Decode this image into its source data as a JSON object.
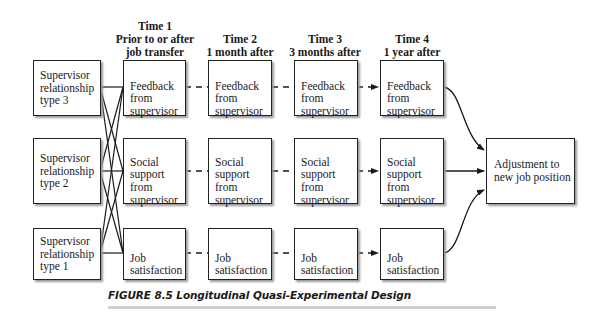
{
  "headers": [
    {
      "time": "Time 1",
      "desc": "Prior to or after",
      "desc2": "job transfer"
    },
    {
      "time": "Time 2",
      "desc": "1 month after"
    },
    {
      "time": "Time 3",
      "desc": "3 months after"
    },
    {
      "time": "Time 4",
      "desc": "1 year after"
    }
  ],
  "groups": [
    {
      "label": "Supervisor\nrelationship\ntype 3"
    },
    {
      "label": "Supervisor\nrelationship\ntype 2"
    },
    {
      "label": "Supervisor\nrelationship\ntype 1"
    }
  ],
  "measures": [
    {
      "label": "Feedback\nfrom\nsupervisor"
    },
    {
      "label": "Social\nsupport\nfrom\nsupervisor"
    },
    {
      "label": "Job\nsatisfaction"
    }
  ],
  "outcome": {
    "label": "Adjustment to\nnew job position"
  },
  "caption": "FIGURE 8.5  Longitudinal Quasi-Experimental Design",
  "colors": {
    "line": "#1a1a1a",
    "shadow": "#9a9a9a",
    "rule": "#cfcfcf"
  }
}
